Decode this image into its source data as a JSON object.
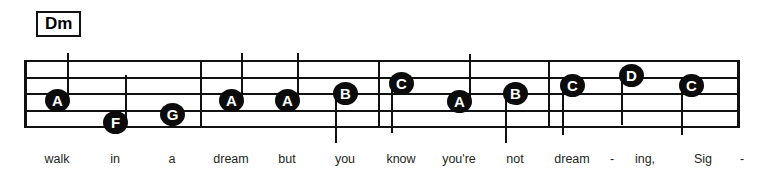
{
  "score": {
    "chord_symbol": "Dm",
    "staff": {
      "line_count": 5,
      "left": 24,
      "right": 737,
      "top": 60,
      "bottom": 128,
      "line_spacing": 16.5
    },
    "barlines_x": [
      24,
      200,
      378,
      548,
      737
    ],
    "notes": [
      {
        "label": "A",
        "x": 57,
        "y": 100,
        "stem": "up",
        "lyric": "walk"
      },
      {
        "label": "F",
        "x": 115,
        "y": 122,
        "stem": "up",
        "lyric": "in"
      },
      {
        "label": "G",
        "x": 172,
        "y": 114,
        "stem": "none",
        "lyric": "a"
      },
      {
        "label": "A",
        "x": 231,
        "y": 100,
        "stem": "up",
        "lyric": "dream"
      },
      {
        "label": "A",
        "x": 287,
        "y": 100,
        "stem": "up",
        "lyric": "but"
      },
      {
        "label": "B",
        "x": 345,
        "y": 93,
        "stem": "down",
        "lyric": "you"
      },
      {
        "label": "C",
        "x": 401,
        "y": 83,
        "stem": "down",
        "lyric": "know"
      },
      {
        "label": "A",
        "x": 459,
        "y": 101,
        "stem": "up",
        "lyric": "you're"
      },
      {
        "label": "B",
        "x": 515,
        "y": 93,
        "stem": "down",
        "lyric": "not"
      },
      {
        "label": "C",
        "x": 572,
        "y": 85,
        "stem": "down",
        "lyric": "dream"
      },
      {
        "label": "D",
        "x": 631,
        "y": 75,
        "stem": "down",
        "lyric": "ing,"
      },
      {
        "label": "C",
        "x": 691,
        "y": 85,
        "stem": "down",
        "lyric": "Sig"
      }
    ],
    "lyrics": [
      {
        "text": "walk",
        "x": 57
      },
      {
        "text": "in",
        "x": 115
      },
      {
        "text": "a",
        "x": 172
      },
      {
        "text": "dream",
        "x": 231
      },
      {
        "text": "but",
        "x": 287
      },
      {
        "text": "you",
        "x": 345
      },
      {
        "text": "know",
        "x": 401
      },
      {
        "text": "you're",
        "x": 459
      },
      {
        "text": "not",
        "x": 515
      },
      {
        "text": "dream",
        "x": 572
      },
      {
        "text": "-",
        "x": 612
      },
      {
        "text": "ing,",
        "x": 645
      },
      {
        "text": "Sig",
        "x": 703
      },
      {
        "text": "-",
        "x": 742
      }
    ],
    "colors": {
      "ink": "#111111",
      "notehead": "#0c0c0c",
      "note_label": "#ffffff",
      "lyric": "#231f20",
      "background": "#ffffff"
    }
  }
}
